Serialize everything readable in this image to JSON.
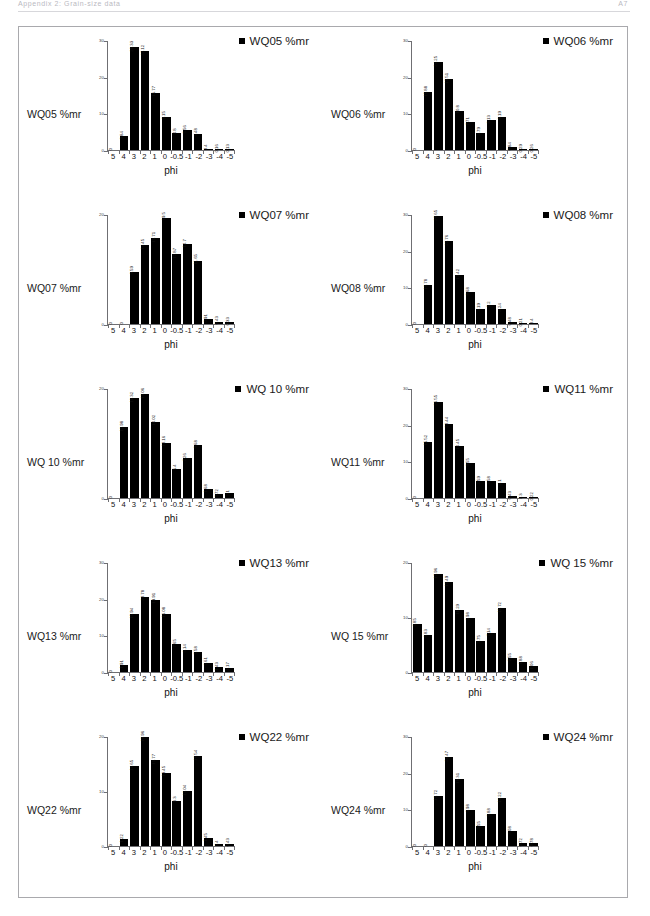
{
  "header": {
    "left_text": "Appendix 2: Grain-size data",
    "right_text": "A7"
  },
  "axis": {
    "x_title": "phi",
    "categories": [
      "5",
      "4",
      "3",
      "2",
      "1",
      "0",
      "-0.5",
      "-1",
      "-2",
      "-3",
      "-4",
      "-5"
    ]
  },
  "chart_data": [
    {
      "type": "bar",
      "title": "WQ05 %mr",
      "legend": "WQ05 %mr",
      "ylabel": "WQ05 %mr",
      "xlabel": "phi",
      "categories": [
        "5",
        "4",
        "3",
        "2",
        "1",
        "0",
        "-0.5",
        "-1",
        "-2",
        "-3",
        "-4",
        "-5"
      ],
      "values": [
        0,
        3.84,
        28.33,
        27.12,
        15.77,
        9.15,
        4.8,
        5.56,
        4.48,
        0.4,
        0.16,
        0.13
      ],
      "value_labels": [
        "0",
        "3.84",
        "28.33",
        "27.12",
        "15.77",
        "9.15",
        "4.8",
        "5.56",
        "4.48",
        "0.4",
        "0.16",
        "0.13"
      ],
      "ylim": [
        0,
        30
      ],
      "yticks": [
        0,
        10,
        20,
        30
      ],
      "ytick_labels": [
        "0",
        "10",
        "20",
        "30"
      ],
      "grid": false,
      "legend_position": "top-right"
    },
    {
      "type": "bar",
      "title": "WQ06 %mr",
      "legend": "WQ06 %mr",
      "ylabel": "WQ06 %mr",
      "xlabel": "phi",
      "categories": [
        "5",
        "4",
        "3",
        "2",
        "1",
        "0",
        "-0.5",
        "-1",
        "-2",
        "-3",
        "-4",
        "-5"
      ],
      "values": [
        0,
        15.88,
        24.25,
        19.51,
        10.8,
        7.71,
        4.79,
        8.13,
        9.19,
        0.84,
        0.29,
        0.26
      ],
      "value_labels": [
        "0",
        "15.88",
        "24.25",
        "19.51",
        "10.8",
        "7.71",
        "4.79",
        "8.13",
        "9.19",
        "0.84",
        "0.29",
        "0.26"
      ],
      "ylim": [
        0,
        30
      ],
      "yticks": [
        0,
        10,
        20,
        30
      ],
      "ytick_labels": [
        "0",
        "10",
        "20",
        "30"
      ],
      "grid": false,
      "legend_position": "top-right"
    },
    {
      "type": "bar",
      "title": "WQ07 %mr",
      "legend": "WQ07 %mr",
      "ylabel": "WQ07 %mr",
      "xlabel": "phi",
      "categories": [
        "5",
        "4",
        "3",
        "2",
        "1",
        "0",
        "-0.5",
        "-1",
        "-2",
        "-3",
        "-4",
        "-5"
      ],
      "values": [
        0,
        0,
        9.59,
        14.45,
        15.71,
        19.5,
        12.87,
        14.7,
        11.65,
        0.91,
        0.43,
        0.33
      ],
      "value_labels": [
        "0",
        "0",
        "9.59",
        "14.45",
        "15.71",
        "19.5",
        "12.87",
        "14.7",
        "11.65",
        "0.91",
        "0.43",
        "0.33"
      ],
      "ylim": [
        0,
        20
      ],
      "yticks": [
        0,
        20
      ],
      "ytick_labels": [
        "0",
        "20"
      ],
      "grid": false,
      "legend_position": "top-right"
    },
    {
      "type": "bar",
      "title": "WQ08 %mr",
      "legend": "WQ08 %mr",
      "ylabel": "WQ08 %mr",
      "xlabel": "phi",
      "categories": [
        "5",
        "4",
        "3",
        "2",
        "1",
        "0",
        "-0.5",
        "-1",
        "-2",
        "-3",
        "-4",
        "-5"
      ],
      "values": [
        0,
        10.78,
        29.65,
        22.76,
        13.42,
        8.68,
        4.19,
        5.2,
        4.24,
        0.48,
        0.21,
        0.4
      ],
      "value_labels": [
        "0",
        "10.78",
        "29.65",
        "22.76",
        "13.42",
        "8.68",
        "4.19",
        "5.2",
        "4.24",
        "0.48",
        "0.21",
        "0.4"
      ],
      "ylim": [
        0,
        30
      ],
      "yticks": [
        0,
        10,
        20,
        30
      ],
      "ytick_labels": [
        "0",
        "10",
        "20",
        "30"
      ],
      "grid": false,
      "legend_position": "top-right"
    },
    {
      "type": "bar",
      "title": "WQ 10 %mr",
      "legend": "WQ 10 %mr",
      "ylabel": "WQ 10 %mr",
      "xlabel": "phi",
      "categories": [
        "5",
        "4",
        "3",
        "2",
        "1",
        "0",
        "-0.5",
        "-1",
        "-2",
        "-3",
        "-4",
        "-5"
      ],
      "values": [
        0,
        12.98,
        18.32,
        19.06,
        14.02,
        10.16,
        5.4,
        7.26,
        9.68,
        1.68,
        0.72,
        1.0
      ],
      "value_labels": [
        "0",
        "12.98",
        "18.32",
        "19.06",
        "14.02",
        "10.16",
        "5.4",
        "7.26",
        "9.68",
        "1.68",
        "0.72",
        "1"
      ],
      "ylim": [
        0,
        20
      ],
      "yticks": [
        0,
        20
      ],
      "ytick_labels": [
        "0",
        "20"
      ],
      "grid": false,
      "legend_position": "top-right"
    },
    {
      "type": "bar",
      "title": "WQ11 %mr",
      "legend": "WQ11 %mr",
      "ylabel": "WQ11 %mr",
      "xlabel": "phi",
      "categories": [
        "5",
        "4",
        "3",
        "2",
        "1",
        "0",
        "-0.5",
        "-1",
        "-2",
        "-3",
        "-4",
        "-5"
      ],
      "values": [
        0,
        15.52,
        26.55,
        20.44,
        14.45,
        9.55,
        4.59,
        4.58,
        4.1,
        0.43,
        0.3,
        0.22
      ],
      "value_labels": [
        "0",
        "15.52",
        "26.55",
        "20.44",
        "14.45",
        "9.55",
        "4.59",
        "4.58",
        "4.1",
        "0.43",
        "0.3",
        "0.22"
      ],
      "ylim": [
        0,
        30
      ],
      "yticks": [
        0,
        10,
        20,
        30
      ],
      "ytick_labels": [
        "0",
        "10",
        "20",
        "30"
      ],
      "grid": false,
      "legend_position": "top-right"
    },
    {
      "type": "bar",
      "title": "WQ13 %mr",
      "legend": "WQ13 %mr",
      "ylabel": "WQ13 %mr",
      "xlabel": "phi",
      "categories": [
        "5",
        "4",
        "3",
        "2",
        "1",
        "0",
        "-0.5",
        "-1",
        "-2",
        "-3",
        "-4",
        "-5"
      ],
      "values": [
        0,
        1.91,
        15.94,
        20.78,
        19.91,
        16.08,
        7.65,
        6.14,
        5.58,
        2.61,
        1.43,
        1.17
      ],
      "value_labels": [
        "0",
        "1.91",
        "15.94",
        "20.78",
        "19.91",
        "16.08",
        "7.65",
        "6.14",
        "5.58",
        "2.61",
        "1.43",
        "1.17"
      ],
      "ylim": [
        0,
        30
      ],
      "yticks": [
        0,
        10,
        20,
        30
      ],
      "ytick_labels": [
        "0",
        "10",
        "20",
        "30"
      ],
      "grid": false,
      "legend_position": "top-right"
    },
    {
      "type": "bar",
      "title": "WQ 15 %mr",
      "legend": "WQ 15 %mr",
      "ylabel": "WQ 15 %mr",
      "xlabel": "phi",
      "categories": [
        "5",
        "4",
        "3",
        "2",
        "1",
        "0",
        "-0.5",
        "-1",
        "-2",
        "-3",
        "-4",
        "-5"
      ],
      "values": [
        8.85,
        6.83,
        17.96,
        16.49,
        11.29,
        9.98,
        5.75,
        7.14,
        11.72,
        2.55,
        1.88,
        1.06
      ],
      "value_labels": [
        "8.85",
        "6.83",
        "17.96",
        "16.49",
        "11.29",
        "9.98",
        "5.75",
        "7.14",
        "11.72",
        "2.55",
        "1.88",
        "1.06"
      ],
      "ylim": [
        0,
        20
      ],
      "yticks": [
        0,
        10,
        20
      ],
      "ytick_labels": [
        "0",
        "10",
        "20"
      ],
      "grid": false,
      "legend_position": "top-right"
    },
    {
      "type": "bar",
      "title": "WQ22 %mr",
      "legend": "WQ22 %mr",
      "ylabel": "WQ22 %mr",
      "xlabel": "phi",
      "categories": [
        "5",
        "4",
        "3",
        "2",
        "1",
        "0",
        "-0.5",
        "-1",
        "-2",
        "-3",
        "-4",
        "-5"
      ],
      "values": [
        0,
        1.22,
        14.65,
        19.96,
        15.77,
        13.45,
        8.3,
        10.04,
        16.54,
        1.45,
        0.4,
        0.43
      ],
      "value_labels": [
        "0",
        "1.22",
        "14.65",
        "19.96",
        "15.77",
        "13.45",
        "8.3",
        "10.04",
        "16.54",
        "1.45",
        "0.4",
        "0.43"
      ],
      "ylim": [
        0,
        20
      ],
      "yticks": [
        0,
        10,
        20
      ],
      "ytick_labels": [
        "0",
        "10",
        "20"
      ],
      "grid": false,
      "legend_position": "top-right"
    },
    {
      "type": "bar",
      "title": "WQ24 %mr",
      "legend": "WQ24 %mr",
      "ylabel": "WQ24 %mr",
      "xlabel": "phi",
      "categories": [
        "5",
        "4",
        "3",
        "2",
        "1",
        "0",
        "-0.5",
        "-1",
        "-2",
        "-3",
        "-4",
        "-5"
      ],
      "values": [
        0,
        0,
        13.72,
        24.47,
        18.31,
        9.98,
        5.55,
        8.88,
        13.22,
        4.08,
        0.72,
        0.78
      ],
      "value_labels": [
        "0",
        "0",
        "13.72",
        "24.47",
        "18.31",
        "9.98",
        "5.55",
        "8.88",
        "13.22",
        "4.08",
        "0.72",
        "0.78"
      ],
      "ylim": [
        0,
        30
      ],
      "yticks": [
        0,
        10,
        20,
        30
      ],
      "ytick_labels": [
        "0",
        "10",
        "20",
        "30"
      ],
      "grid": false,
      "legend_position": "top-right"
    }
  ]
}
